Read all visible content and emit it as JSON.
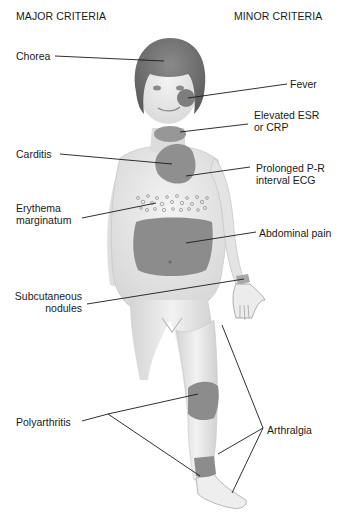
{
  "headers": {
    "major": "MAJOR CRITERIA",
    "minor": "MINOR CRITERIA"
  },
  "major_criteria": [
    {
      "id": "chorea",
      "label": "Chorea",
      "location": "head"
    },
    {
      "id": "carditis",
      "label": "Carditis",
      "location": "heart"
    },
    {
      "id": "erythema",
      "label_line1": "Erythema",
      "label_line2": "marginatum",
      "location": "trunk"
    },
    {
      "id": "nodules",
      "label_line1": "Subcutaneous",
      "label_line2": "nodules",
      "location": "wrist"
    },
    {
      "id": "polyarthritis",
      "label": "Polyarthritis",
      "location": "knee, ankle"
    }
  ],
  "minor_criteria": [
    {
      "id": "fever",
      "label": "Fever",
      "location": "cheek"
    },
    {
      "id": "esr",
      "label_line1": "Elevated ESR",
      "label_line2": "or CRP",
      "location": "neck"
    },
    {
      "id": "pr",
      "label_line1": "Prolonged P-R",
      "label_line2": "interval ECG",
      "location": "heart"
    },
    {
      "id": "abdominal",
      "label": "Abdominal pain",
      "location": "abdomen"
    },
    {
      "id": "arthralgia",
      "label": "Arthralgia",
      "location": "leg, ankle"
    }
  ],
  "colors": {
    "skin": "#e9e9e9",
    "skin_shadow": "#cfcfcf",
    "hair": "#7a7a7a",
    "highlight": "#8c8c8c",
    "line": "#1a1a1a"
  }
}
